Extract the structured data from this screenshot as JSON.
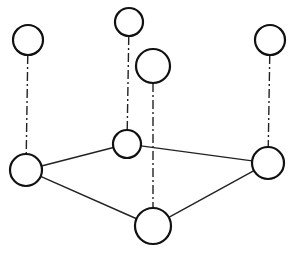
{
  "diagram": {
    "type": "graph-projection",
    "colors": {
      "stroke": "#111111",
      "background": "#ffffff",
      "node_fill": "#ffffff"
    },
    "nodes": [
      {
        "id": "base-left",
        "cx": 26,
        "cy": 170,
        "r": 16
      },
      {
        "id": "base-middle",
        "cx": 127,
        "cy": 144,
        "r": 14
      },
      {
        "id": "base-right",
        "cx": 268,
        "cy": 163,
        "r": 16
      },
      {
        "id": "base-bottom",
        "cx": 153,
        "cy": 226,
        "r": 18
      },
      {
        "id": "top-left",
        "cx": 28,
        "cy": 40,
        "r": 15
      },
      {
        "id": "top-middle",
        "cx": 129,
        "cy": 22,
        "r": 14
      },
      {
        "id": "top-center",
        "cx": 153,
        "cy": 66,
        "r": 17
      },
      {
        "id": "top-right",
        "cx": 270,
        "cy": 40,
        "r": 15
      }
    ],
    "solid_edges": [
      {
        "from": "base-left",
        "to": "base-middle"
      },
      {
        "from": "base-left",
        "to": "base-bottom"
      },
      {
        "from": "base-middle",
        "to": "base-right"
      },
      {
        "from": "base-bottom",
        "to": "base-right"
      }
    ],
    "dashdot_edges": [
      {
        "from": "top-left",
        "to": "base-left"
      },
      {
        "from": "top-middle",
        "to": "base-middle"
      },
      {
        "from": "top-center",
        "to": "base-bottom"
      },
      {
        "from": "top-right",
        "to": "base-right"
      }
    ]
  }
}
